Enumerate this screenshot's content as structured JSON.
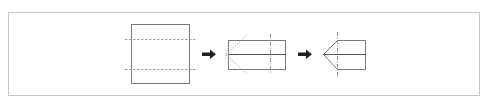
{
  "diagram": {
    "colors": {
      "frame": "#c8c8c8",
      "outline": "#7a7a7a",
      "solid_line": "#555555",
      "fold_line": "#8a8a8a",
      "arrow": "#222222"
    },
    "steps": [
      {
        "id": "step-1",
        "shape": "square",
        "description": "Square sheet with two horizontal dashed fold lines"
      },
      {
        "id": "step-2",
        "shape": "rectangle",
        "description": "Folded rectangle with center crease, vertical dashed fold line and diagonal dotted fold lines at left"
      },
      {
        "id": "step-3",
        "shape": "pentagon",
        "description": "Left corners folded to a point, forming a house-like pentagon with vertical dashed line"
      }
    ],
    "arrows": [
      {
        "id": "arrow-1",
        "from": "step-1",
        "to": "step-2",
        "glyph": "right-arrow-icon"
      },
      {
        "id": "arrow-2",
        "from": "step-2",
        "to": "step-3",
        "glyph": "right-arrow-icon"
      }
    ]
  }
}
